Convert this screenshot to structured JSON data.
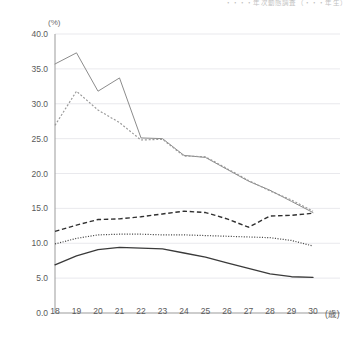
{
  "header": {
    "clipped_note": "・・・・年次動態調査（・・・年生）"
  },
  "chart_data": {
    "type": "line",
    "title": "",
    "subtitle": "",
    "xlabel": "歳",
    "ylabel": "(%)",
    "x": [
      18,
      19,
      20,
      21,
      22,
      23,
      24,
      25,
      26,
      27,
      28,
      29,
      30
    ],
    "xlim": [
      18,
      30
    ],
    "ylim": [
      0.0,
      40.0
    ],
    "ytick_labels": [
      "0.0",
      "5.0",
      "10.0",
      "15.0",
      "20.0",
      "25.0",
      "30.0",
      "35.0",
      "40.0"
    ],
    "yticks": [
      0.0,
      5.0,
      10.0,
      15.0,
      20.0,
      25.0,
      30.0,
      35.0,
      40.0
    ],
    "xtick_labels": [
      "18",
      "19",
      "20",
      "21",
      "22",
      "23",
      "24",
      "25",
      "26",
      "27",
      "28",
      "29",
      "30"
    ],
    "grid": true,
    "grid_axis": "y",
    "legend": false,
    "legend_position": "none",
    "series": [
      {
        "name": "series-1-solid-gray",
        "style": "solid",
        "color": "#8c8c8c",
        "width": 1.0,
        "values": [
          35.7,
          37.3,
          31.8,
          33.7,
          25.1,
          25.0,
          22.6,
          22.3,
          20.6,
          18.9,
          17.6,
          16.0,
          14.4
        ]
      },
      {
        "name": "series-2-dotted-gray",
        "style": "dotted",
        "color": "#9a9a9a",
        "width": 1.2,
        "values": [
          26.9,
          31.8,
          29.1,
          27.3,
          24.8,
          24.9,
          22.5,
          22.4,
          20.7,
          19.0,
          17.5,
          16.2,
          14.6
        ]
      },
      {
        "name": "series-3-dashed-dark",
        "style": "dashed",
        "color": "#2f2f2f",
        "width": 1.4,
        "values": [
          11.7,
          12.6,
          13.4,
          13.5,
          13.8,
          14.2,
          14.6,
          14.4,
          13.5,
          12.3,
          13.9,
          14.0,
          14.3
        ]
      },
      {
        "name": "series-4-fine-dotted-dark",
        "style": "fine-dotted",
        "color": "#4a4a4a",
        "width": 1.2,
        "values": [
          9.9,
          10.7,
          11.2,
          11.3,
          11.3,
          11.2,
          11.2,
          11.1,
          11.0,
          10.9,
          10.8,
          10.4,
          9.6
        ]
      },
      {
        "name": "series-5-solid-dark",
        "style": "solid",
        "color": "#3a3a3a",
        "width": 1.3,
        "values": [
          6.9,
          8.2,
          9.1,
          9.4,
          9.3,
          9.2,
          8.6,
          8.0,
          7.2,
          6.4,
          5.6,
          5.2,
          5.1
        ]
      }
    ]
  }
}
